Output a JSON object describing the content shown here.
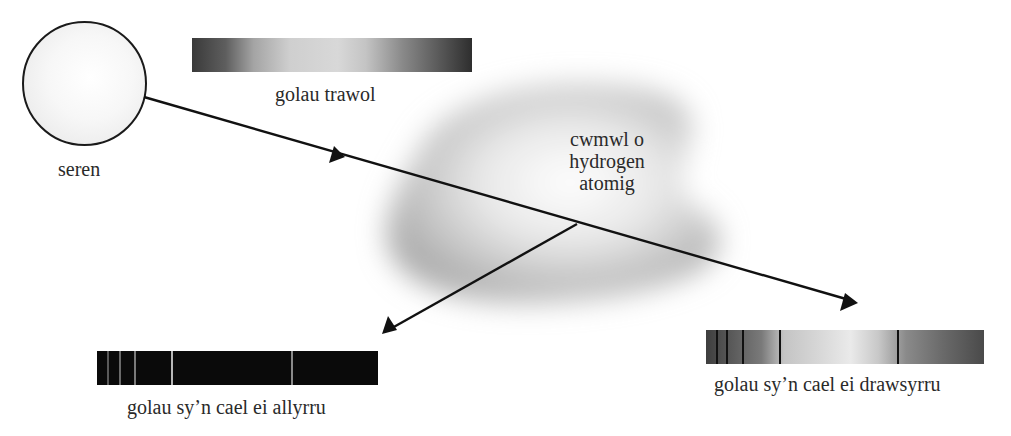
{
  "diagram": {
    "star": {
      "label": "seren"
    },
    "continuous_spectrum": {
      "label": "golau trawol"
    },
    "cloud": {
      "label_lines": [
        "cwmwl o",
        "hydrogen",
        "atomig"
      ]
    },
    "emission_spectrum": {
      "label": "golau sy’n cael ei allyrru",
      "line_color": "#9a9a9a",
      "background": "#0a0a0a"
    },
    "absorption_spectrum": {
      "label": "golau sy’n cael ei drawsyrru",
      "line_color": "#111111"
    },
    "arrows": [
      {
        "name": "incident-light",
        "from": "star",
        "to": "absorption_spectrum"
      },
      {
        "name": "emitted-light",
        "from": "cloud",
        "to": "emission_spectrum"
      }
    ]
  }
}
